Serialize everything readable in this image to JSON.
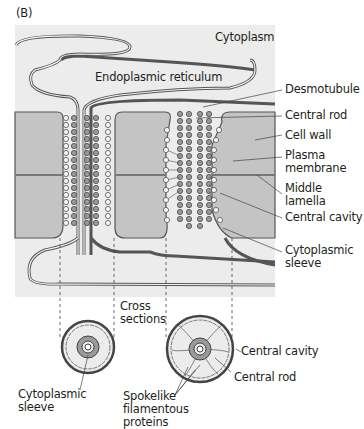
{
  "figure": {
    "panel_label": "(B)",
    "colors": {
      "cytoplasm_bg": "#ececec",
      "cell_wall": "#c4c4c4",
      "membrane": "#555555",
      "particle": "#9a9a9a",
      "text": "#231f20"
    }
  },
  "labels": {
    "cytoplasm": "Cytoplasm",
    "er": "Endoplasmic reticulum",
    "desmotubule": "Desmotubule",
    "central_rod": "Central rod",
    "cell_wall": "Cell wall",
    "plasma_membrane_1": "Plasma",
    "plasma_membrane_2": "membrane",
    "middle_lamella_1": "Middle",
    "middle_lamella_2": "lamella",
    "central_cavity": "Central cavity",
    "cyto_sleeve_1": "Cytoplasmic",
    "cyto_sleeve_2": "sleeve",
    "cross_1": "Cross",
    "cross_2": "sections",
    "cs_central_cavity": "Central cavity",
    "cs_central_rod": "Central rod",
    "cs_sleeve_1": "Cytoplasmic",
    "cs_sleeve_2": "sleeve",
    "spoke_1": "Spokelike",
    "spoke_2": "filamentous",
    "spoke_3": "proteins"
  }
}
